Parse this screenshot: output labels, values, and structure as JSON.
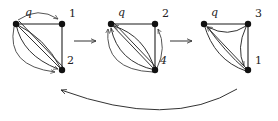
{
  "diagram": {
    "graphs": [
      {
        "id": "graph-1",
        "nodes": [
          {
            "id": "q",
            "label": "q",
            "x": 16,
            "y": 24
          },
          {
            "id": "n1",
            "label": "1",
            "x": 62,
            "y": 24
          },
          {
            "id": "n2",
            "label": "2",
            "x": 62,
            "y": 70
          }
        ]
      },
      {
        "id": "graph-2",
        "nodes": [
          {
            "id": "q",
            "label": "q",
            "x": 111,
            "y": 24
          },
          {
            "id": "n2",
            "label": "2",
            "x": 155,
            "y": 24
          },
          {
            "id": "n4",
            "label": "4",
            "x": 155,
            "y": 70
          }
        ]
      },
      {
        "id": "graph-3",
        "nodes": [
          {
            "id": "q",
            "label": "q",
            "x": 204,
            "y": 24
          },
          {
            "id": "n3",
            "label": "3",
            "x": 248,
            "y": 24
          },
          {
            "id": "n1",
            "label": "1",
            "x": 248,
            "y": 70
          }
        ]
      }
    ],
    "transitions": [
      {
        "from": "graph-1",
        "to": "graph-2",
        "type": "straight-arrow"
      },
      {
        "from": "graph-2",
        "to": "graph-3",
        "type": "straight-arrow"
      },
      {
        "from": "graph-3",
        "to": "graph-1",
        "type": "curved-return-arrow"
      }
    ]
  },
  "labels": {
    "g1_q": "q",
    "g1_a": "1",
    "g1_b": "2",
    "g2_q": "q",
    "g2_a": "2",
    "g2_b": "4",
    "g3_q": "q",
    "g3_a": "3",
    "g3_b": "1"
  },
  "colors": {
    "node": "#111111",
    "edge": "#333333",
    "background": "#ffffff"
  }
}
